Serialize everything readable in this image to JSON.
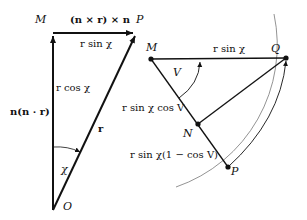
{
  "left_diagram": {
    "points": {
      "M": "M",
      "P": "P",
      "O": "O"
    },
    "labels": {
      "top_vector": "(n × r) × n",
      "top_side": "r sin χ",
      "vertical_side": "r cos χ",
      "left_vector": "n(n · r)",
      "hypotenuse": "r",
      "angle": "χ"
    }
  },
  "right_diagram": {
    "points": {
      "M": "M",
      "Q": "Q",
      "N": "N",
      "P": "P"
    },
    "labels": {
      "top_side": "r sin χ",
      "angle": "V",
      "MN_side": "r sin χ cos V",
      "NP_side": "r sin χ(1 − cos V)"
    }
  },
  "colors": {
    "line": "#111111",
    "circle": "#777777"
  }
}
